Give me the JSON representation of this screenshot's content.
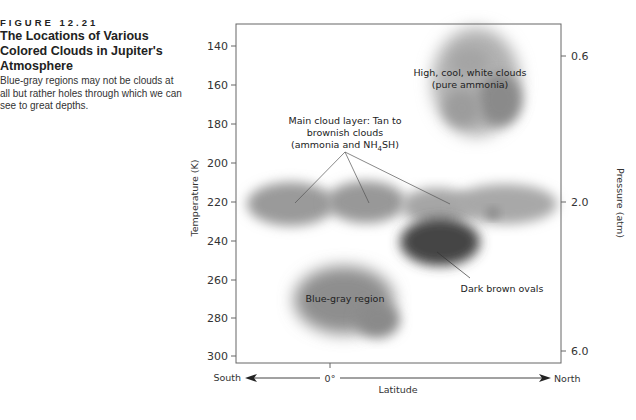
{
  "figure": {
    "number": "FIGURE 12.21",
    "title": "The Locations of Various Colored Clouds in Jupiter's Atmosphere",
    "title_lines": [
      "The Locations of Various",
      "Colored Clouds in Jupiter's",
      "Atmosphere"
    ],
    "description": "Blue-gray regions may not be clouds at all but rather holes through which we can see to great depths."
  },
  "axes": {
    "left_title": "Temperature (K)",
    "right_title": "Pressure (atm)",
    "bottom_title": "Latitude",
    "south_label": "South",
    "north_label": "North",
    "zero_label": "0°",
    "left_ticks": [
      "140",
      "160",
      "180",
      "200",
      "220",
      "240",
      "260",
      "280",
      "300"
    ],
    "right_ticks": [
      "0.6",
      "2.0",
      "6.0"
    ]
  },
  "annotations": {
    "white_clouds": [
      "High, cool, white clouds",
      "(pure ammonia)"
    ],
    "main_layer": [
      "Main cloud layer: Tan to",
      "brownish clouds",
      "(ammonia and NH",
      "4",
      "SH)"
    ],
    "dark_ovals": "Dark brown ovals",
    "blue_gray": "Blue-gray region"
  },
  "colors": {
    "cloud_light": "#9a9a9a",
    "cloud_dark": "#4a4a4a",
    "axis": "#666666"
  }
}
